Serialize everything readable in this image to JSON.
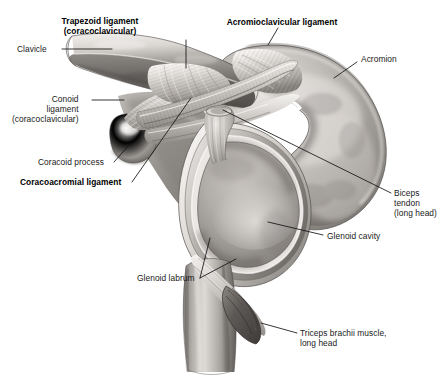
{
  "figure": {
    "background_color": "#ffffff",
    "ink_color": "#1a1a1a",
    "style": "grayscale airbrush medical illustration"
  },
  "labels": [
    {
      "id": "clavicle",
      "text": "Clavicle",
      "bold": false,
      "align": "right",
      "x": 17,
      "y": 44,
      "leader": [
        [
          62,
          49
        ],
        [
          112,
          49
        ]
      ]
    },
    {
      "id": "trapezoid-ligament",
      "text": "Trapezoid ligament\n(coracoclavicular)",
      "bold": true,
      "align": "center",
      "x": 100,
      "y": 16,
      "leader": [
        [
          186,
          40
        ],
        [
          186,
          68
        ]
      ]
    },
    {
      "id": "acromioclavicular-ligament",
      "text": "Acromioclavicular ligament",
      "bold": true,
      "align": "center",
      "x": 282,
      "y": 17,
      "leader": [
        [
          278,
          28
        ],
        [
          268,
          45
        ]
      ]
    },
    {
      "id": "acromion",
      "text": "Acromion",
      "bold": false,
      "align": "left",
      "x": 361,
      "y": 54,
      "leader": [
        [
          357,
          62
        ],
        [
          334,
          78
        ]
      ]
    },
    {
      "id": "conoid-ligament",
      "text": "Conoid\nligament\n(coracoclavicular)",
      "bold": false,
      "align": "right",
      "x": 12,
      "y": 94,
      "leader": [
        [
          92,
          100
        ],
        [
          124,
          100
        ]
      ]
    },
    {
      "id": "coracoid-process",
      "text": "Coracoid process",
      "bold": false,
      "align": "right",
      "x": 38,
      "y": 157,
      "leader": [
        [
          114,
          162
        ],
        [
          131,
          143
        ]
      ]
    },
    {
      "id": "coracoacromial-ligament",
      "text": "Coracoacromial ligament",
      "bold": true,
      "align": "right",
      "x": 20,
      "y": 177,
      "leader": [
        [
          132,
          182
        ],
        [
          191,
          98
        ]
      ]
    },
    {
      "id": "biceps-tendon",
      "text": "Biceps\ntendon\n(long head)",
      "bold": false,
      "align": "left",
      "x": 394,
      "y": 188,
      "leader": [
        [
          391,
          193
        ],
        [
          223,
          110
        ]
      ]
    },
    {
      "id": "glenoid-cavity",
      "text": "Glenoid cavity",
      "bold": false,
      "align": "left",
      "x": 327,
      "y": 231,
      "leader": [
        [
          323,
          235
        ],
        [
          268,
          222
        ]
      ]
    },
    {
      "id": "glenoid-labrum",
      "text": "Glenoid labrum",
      "bold": false,
      "align": "right",
      "x": 137,
      "y": 273,
      "leader": [
        [
          200,
          278
        ],
        [
          236,
          259
        ]
      ],
      "leader2": [
        [
          200,
          278
        ],
        [
          210,
          238
        ]
      ]
    },
    {
      "id": "triceps-brachii",
      "text": "Triceps brachii muscle,\nlong head",
      "bold": false,
      "align": "left",
      "x": 300,
      "y": 328,
      "leader": [
        [
          297,
          333
        ],
        [
          261,
          323
        ]
      ]
    }
  ]
}
